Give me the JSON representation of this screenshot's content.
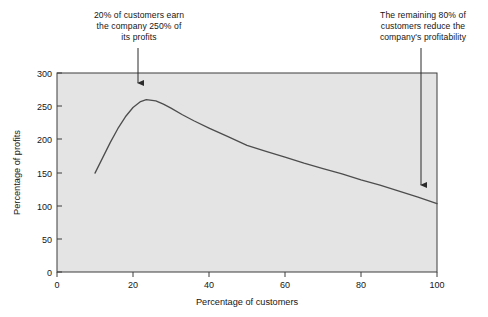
{
  "chart_data": {
    "type": "line",
    "title": "",
    "xlabel": "Percentage of customers",
    "ylabel": "Percentage of profits",
    "xlim": [
      0,
      100
    ],
    "ylim": [
      0,
      300
    ],
    "xticks": [
      0,
      20,
      40,
      60,
      80,
      100
    ],
    "yticks": [
      0,
      50,
      100,
      150,
      200,
      250,
      300
    ],
    "grid": false,
    "legend": false,
    "plot_background": "#e4e4e4",
    "line_color": "#4d4d4d",
    "series": [
      {
        "name": "Cumulative percentage of profits",
        "x": [
          10,
          12,
          14,
          16,
          18,
          20,
          22,
          23.5,
          26,
          28,
          30,
          33,
          36,
          40,
          45,
          50,
          55,
          60,
          65,
          70,
          75,
          80,
          85,
          90,
          95,
          100
        ],
        "values": [
          149,
          172,
          195,
          216,
          234,
          248,
          257,
          260,
          258,
          253,
          247,
          237,
          228,
          217,
          204,
          191,
          182,
          173,
          164,
          156,
          148,
          139,
          131,
          122,
          113,
          103
        ]
      }
    ],
    "annotations": [
      {
        "id": "peak-callout",
        "text": "20% of customers earn\nthe company 250% of\nits profits",
        "arrow_target_x": 23.5,
        "arrow_target_y": 260
      },
      {
        "id": "tail-callout",
        "text": "The remaining 80% of\ncustomers reduce the\ncompany's profitability",
        "arrow_target_x": 100,
        "arrow_target_y": 120
      }
    ]
  },
  "axes": {
    "x_title": "Percentage of customers",
    "y_title": "Percentage of profits",
    "x_tick_labels": [
      "0",
      "20",
      "40",
      "60",
      "80",
      "100"
    ],
    "y_tick_labels": [
      "0",
      "50",
      "100",
      "150",
      "200",
      "250",
      "300"
    ]
  },
  "callouts": {
    "left": "20% of customers earn\nthe company 250% of\nits profits",
    "right": "The remaining 80% of\ncustomers reduce the\ncompany's profitability"
  }
}
